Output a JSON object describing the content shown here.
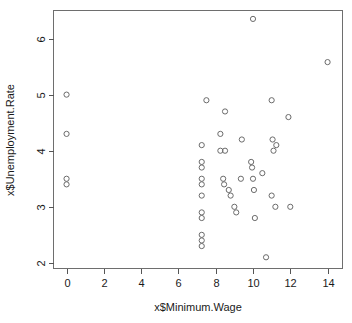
{
  "chart_data": {
    "type": "scatter",
    "title": "",
    "xlabel": "x$Minimum.Wage",
    "ylabel": "x$Unemployment.Rate",
    "xlim": [
      -0.7,
      14.8
    ],
    "ylim": [
      1.9,
      6.5
    ],
    "xticks": [
      0,
      2,
      4,
      6,
      8,
      10,
      12,
      14
    ],
    "yticks": [
      2,
      3,
      4,
      5,
      6
    ],
    "xtick_labels": [
      "0",
      "2",
      "4",
      "6",
      "8",
      "10",
      "12",
      "14"
    ],
    "ytick_labels": [
      "2",
      "3",
      "4",
      "5",
      "6"
    ],
    "grid": false,
    "legend": null,
    "marker": "open-circle",
    "marker_color": "#6b6b6b",
    "points": [
      {
        "x": 0.0,
        "y": 5.0
      },
      {
        "x": 0.0,
        "y": 4.3
      },
      {
        "x": 0.0,
        "y": 3.5
      },
      {
        "x": 0.0,
        "y": 3.4
      },
      {
        "x": 7.25,
        "y": 4.1
      },
      {
        "x": 7.25,
        "y": 3.8
      },
      {
        "x": 7.25,
        "y": 3.7
      },
      {
        "x": 7.25,
        "y": 3.5
      },
      {
        "x": 7.25,
        "y": 3.4
      },
      {
        "x": 7.25,
        "y": 3.2
      },
      {
        "x": 7.25,
        "y": 2.9
      },
      {
        "x": 7.25,
        "y": 2.8
      },
      {
        "x": 7.25,
        "y": 2.5
      },
      {
        "x": 7.25,
        "y": 2.4
      },
      {
        "x": 7.25,
        "y": 2.3
      },
      {
        "x": 7.5,
        "y": 4.9
      },
      {
        "x": 8.25,
        "y": 4.3
      },
      {
        "x": 8.25,
        "y": 4.0
      },
      {
        "x": 8.5,
        "y": 4.7
      },
      {
        "x": 8.5,
        "y": 4.0
      },
      {
        "x": 8.4,
        "y": 3.5
      },
      {
        "x": 8.45,
        "y": 3.4
      },
      {
        "x": 8.7,
        "y": 3.3
      },
      {
        "x": 8.8,
        "y": 3.2
      },
      {
        "x": 9.0,
        "y": 3.0
      },
      {
        "x": 9.1,
        "y": 2.9
      },
      {
        "x": 9.4,
        "y": 4.2
      },
      {
        "x": 9.35,
        "y": 3.5
      },
      {
        "x": 9.9,
        "y": 3.8
      },
      {
        "x": 9.95,
        "y": 3.7
      },
      {
        "x": 10.0,
        "y": 3.5
      },
      {
        "x": 10.05,
        "y": 3.3
      },
      {
        "x": 10.0,
        "y": 6.35
      },
      {
        "x": 10.1,
        "y": 2.8
      },
      {
        "x": 10.5,
        "y": 3.6
      },
      {
        "x": 10.7,
        "y": 2.1
      },
      {
        "x": 11.0,
        "y": 4.9
      },
      {
        "x": 11.05,
        "y": 4.2
      },
      {
        "x": 11.1,
        "y": 4.0
      },
      {
        "x": 11.25,
        "y": 4.1
      },
      {
        "x": 11.0,
        "y": 3.2
      },
      {
        "x": 11.2,
        "y": 3.0
      },
      {
        "x": 11.9,
        "y": 4.6
      },
      {
        "x": 12.0,
        "y": 3.0
      },
      {
        "x": 14.0,
        "y": 5.58
      }
    ]
  }
}
